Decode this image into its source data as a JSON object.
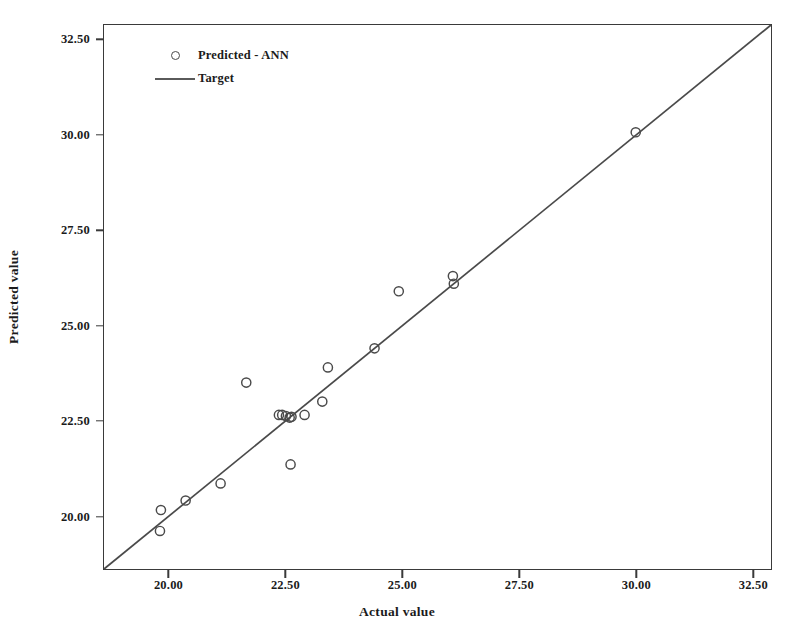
{
  "chart_data": {
    "type": "scatter",
    "title": "",
    "xlabel": "Actual value",
    "ylabel": "Predicted value",
    "xlim": [
      18.6,
      32.9
    ],
    "ylim": [
      18.6,
      32.9
    ],
    "xticks": [
      "20.00",
      "22.50",
      "25.00",
      "27.50",
      "30.00",
      "32.50"
    ],
    "xtick_values": [
      20.0,
      22.5,
      25.0,
      27.5,
      30.0,
      32.5
    ],
    "yticks": [
      "20.00",
      "22.50",
      "25.00",
      "27.50",
      "30.00",
      "32.50"
    ],
    "ytick_values": [
      20.0,
      22.5,
      25.0,
      27.5,
      30.0,
      32.5
    ],
    "grid": false,
    "legend_position": "top-left",
    "series": [
      {
        "name": "Predicted - ANN",
        "marker": "open-circle",
        "color": "#4a4a4a",
        "points": [
          [
            19.8,
            19.6
          ],
          [
            19.82,
            20.15
          ],
          [
            20.35,
            20.4
          ],
          [
            21.1,
            20.85
          ],
          [
            21.65,
            23.5
          ],
          [
            22.35,
            22.65
          ],
          [
            22.42,
            22.65
          ],
          [
            22.5,
            22.62
          ],
          [
            22.58,
            22.58
          ],
          [
            22.62,
            22.6
          ],
          [
            22.6,
            21.35
          ],
          [
            22.9,
            22.65
          ],
          [
            23.28,
            23.0
          ],
          [
            23.4,
            23.9
          ],
          [
            24.4,
            24.4
          ],
          [
            24.92,
            25.9
          ],
          [
            26.08,
            26.3
          ],
          [
            26.1,
            26.1
          ],
          [
            30.0,
            30.08
          ]
        ]
      },
      {
        "name": "Target",
        "marker": "line",
        "color": "#4a4a4a",
        "description": "identity line y = x spanning the full axis range",
        "line": [
          [
            18.6,
            18.6
          ],
          [
            32.9,
            32.9
          ]
        ]
      }
    ]
  },
  "legend": {
    "items": [
      {
        "label": "Predicted - ANN",
        "key": "open-circle"
      },
      {
        "label": "Target",
        "key": "line"
      }
    ]
  },
  "axes": {
    "x_title": "Actual value",
    "y_title": "Predicted value"
  }
}
